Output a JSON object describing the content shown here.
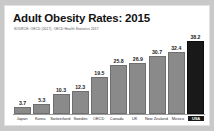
{
  "chart_data": {
    "type": "bar",
    "title": "Adult Obesity Rates: 2015",
    "subtitle": "SOURCE: OECD (2017), OECD Health Statistics 2017",
    "xlabel": "",
    "ylabel": "",
    "ylim": [
      0,
      40
    ],
    "grid": false,
    "legend": null,
    "categories": [
      "Japan",
      "Korea",
      "Switzerland",
      "Sweden",
      "OECD",
      "Canada",
      "UK",
      "New Zealand",
      "Mexico",
      "USA"
    ],
    "values": [
      3.7,
      5.3,
      10.3,
      12.3,
      19.5,
      25.8,
      26.9,
      30.7,
      32.4,
      38.2
    ],
    "value_labels": [
      "3.7",
      "5.3",
      "10.3",
      "12.3",
      "19.5",
      "25.8",
      "26.9",
      "30.7",
      "32.4",
      "38.2"
    ],
    "highlight_category": "USA",
    "colors": {
      "bar": "#8a8a8a",
      "bar_highlight": "#191919",
      "background": "#ffffff",
      "page_background": "#c9c9c9",
      "text": "#131313"
    }
  }
}
